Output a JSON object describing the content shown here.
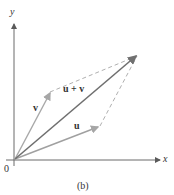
{
  "figure": {
    "caption": "(b)",
    "top_caption_partial": "(a)",
    "axes": {
      "x_label": "x",
      "y_label": "y",
      "origin_label": "0"
    },
    "vectors": [
      {
        "name": "u",
        "label": "u",
        "from": [
          0,
          0
        ],
        "to": [
          85,
          33
        ],
        "color": "#a0a0a0"
      },
      {
        "name": "v",
        "label": "v",
        "from": [
          0,
          0
        ],
        "to": [
          36,
          68
        ],
        "color": "#a8a8a8"
      },
      {
        "name": "u_plus_v",
        "label": "u + v",
        "from": [
          0,
          0
        ],
        "to": [
          123,
          105
        ],
        "color": "#6f6f6f"
      }
    ],
    "parallelogram_edges": "dashed",
    "colors": {
      "axis": "#6a6a6a",
      "dashed": "#b0b0b0",
      "text": "#333333"
    }
  }
}
